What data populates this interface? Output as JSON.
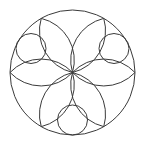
{
  "figure": {
    "type": "geometric-rosette",
    "canvas": {
      "width": 146,
      "height": 145,
      "background": "#ffffff"
    },
    "stroke_color": "#3a3a3a",
    "stroke_width": 1,
    "outer_circle": {
      "cx": 72.5,
      "cy": 72.5,
      "r": 62.5
    },
    "petals": {
      "count": 6,
      "tip_angles_deg": [
        0,
        60,
        120,
        180,
        240,
        300
      ],
      "arc_radius": 43
    },
    "small_circles": [
      {
        "name": "upper-left",
        "angle_deg": 150,
        "cx": 31,
        "cy": 48.5,
        "r": 15
      },
      {
        "name": "upper-right",
        "angle_deg": 30,
        "cx": 114,
        "cy": 48.5,
        "r": 15
      },
      {
        "name": "bottom",
        "angle_deg": 270,
        "cx": 72.5,
        "cy": 120,
        "r": 15
      }
    ]
  }
}
